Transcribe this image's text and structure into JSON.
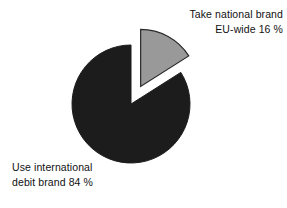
{
  "chart_data": {
    "type": "pie",
    "title": "",
    "subtitle": "",
    "xlabel": "",
    "ylabel": "",
    "legend_position": "none",
    "grid": false,
    "exploded_slice": "Take national brand EU-wide",
    "categories": [
      "Use international debit brand",
      "Take national brand EU-wide"
    ],
    "values": [
      84,
      16
    ],
    "unit": "%",
    "slices": [
      {
        "label": "Use international debit brand",
        "label_line_1": "Use international",
        "label_line_2": "debit brand 84 %",
        "value": 84,
        "value_text": "84 %",
        "color": "#1c1c1c",
        "exploded": false,
        "start_angle_deg": 57.6,
        "end_angle_deg": 360.0
      },
      {
        "label": "Take national brand EU-wide",
        "label_line_1": "Take national brand",
        "label_line_2": "EU-wide 16 %",
        "value": 16,
        "value_text": "16 %",
        "color": "#999999",
        "exploded": true,
        "start_angle_deg": 0.0,
        "end_angle_deg": 57.6
      }
    ]
  },
  "labels": {
    "national": {
      "line1": "Take national brand",
      "line2": "EU-wide 16 %"
    },
    "international": {
      "line1": "Use international",
      "line2": "debit brand 84 %"
    }
  },
  "colors": {
    "dark_slice": "#1c1c1c",
    "gray_slice": "#999999",
    "slice_outline": "#2a2a2a",
    "background": "#ffffff",
    "text": "#111111"
  }
}
